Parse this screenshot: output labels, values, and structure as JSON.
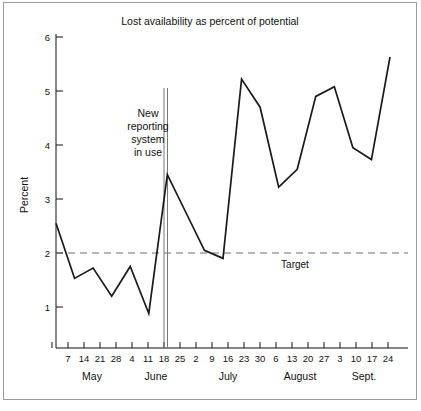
{
  "chart_data": {
    "type": "line",
    "title": "Lost availability as percent of potential",
    "xlabel": "",
    "ylabel": "Percent",
    "ylim": [
      0,
      6
    ],
    "yticks": [
      1,
      2,
      3,
      4,
      5,
      6
    ],
    "grid": false,
    "legend": null,
    "x_tick_labels": [
      "7",
      "14",
      "21",
      "28",
      "4",
      "11",
      "18",
      "25",
      "2",
      "9",
      "16",
      "23",
      "30",
      "6",
      "13",
      "20",
      "27",
      "3",
      "10",
      "17",
      "24"
    ],
    "month_groups": [
      {
        "label": "May",
        "ticks": [
          "7",
          "14",
          "21",
          "28"
        ]
      },
      {
        "label": "June",
        "ticks": [
          "4",
          "11",
          "18",
          "25"
        ]
      },
      {
        "label": "July",
        "ticks": [
          "2",
          "9",
          "16",
          "23",
          "30"
        ]
      },
      {
        "label": "August",
        "ticks": [
          "6",
          "13",
          "20",
          "27"
        ]
      },
      {
        "label": "Sept.",
        "ticks": [
          "3",
          "10",
          "17",
          "24"
        ]
      }
    ],
    "series": [
      {
        "name": "Lost availability",
        "values": [
          2.55,
          1.53,
          1.72,
          1.2,
          1.75,
          0.88,
          3.45,
          2.75,
          2.05,
          1.9,
          5.22,
          4.7,
          3.22,
          3.55,
          4.9,
          5.08,
          3.95,
          3.73,
          5.63
        ]
      }
    ],
    "reference_lines": [
      {
        "name": "Target",
        "label": "Target",
        "value": 2.0,
        "orientation": "horizontal",
        "style": "dashed",
        "color": "#6f6f6f"
      }
    ],
    "annotations": [
      {
        "name": "new-reporting-system",
        "lines": [
          "New",
          "reporting",
          "system",
          "in use"
        ],
        "marker": "vertical-double-line",
        "at_tick": "11",
        "at_month": "June"
      }
    ]
  },
  "labels": {
    "target": "Target",
    "y_axis_title": "Percent",
    "annotation_line_1": "New",
    "annotation_line_2": "reporting",
    "annotation_line_3": "system",
    "annotation_line_4": "in use",
    "title": "Lost availability as percent of potential"
  },
  "colors": {
    "series": "#1a1a1a",
    "target": "#6f6f6f",
    "event_marker": "#777777",
    "axis": "#111111",
    "frame": "#9a9a9a",
    "background": "#ffffff"
  }
}
